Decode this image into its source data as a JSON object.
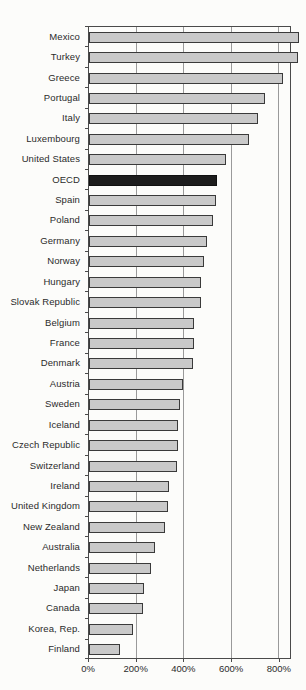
{
  "chart_data": {
    "type": "bar",
    "orientation": "horizontal",
    "title": "",
    "xlabel": "",
    "ylabel": "",
    "categories": [
      "Mexico",
      "Turkey",
      "Greece",
      "Portugal",
      "Italy",
      "Luxembourg",
      "United States",
      "OECD",
      "Spain",
      "Poland",
      "Germany",
      "Norway",
      "Hungary",
      "Slovak Republic",
      "Belgium",
      "France",
      "Denmark",
      "Austria",
      "Sweden",
      "Iceland",
      "Czech Republic",
      "Switzerland",
      "Ireland",
      "United Kingdom",
      "New Zealand",
      "Australia",
      "Netherlands",
      "Japan",
      "Canada",
      "Korea, Rep.",
      "Finland"
    ],
    "values": [
      880,
      875,
      815,
      735,
      705,
      670,
      570,
      535,
      528,
      515,
      493,
      480,
      464,
      464,
      434,
      434,
      432,
      391,
      377,
      369,
      368,
      363,
      329,
      324,
      312,
      270,
      254,
      224,
      219,
      177,
      123
    ],
    "unit": "%",
    "xlim": [
      0,
      851
    ],
    "x_ticks": [
      0,
      200,
      400,
      600,
      800
    ],
    "x_tick_labels": [
      "0%",
      "200%",
      "400%",
      "600%",
      "800%"
    ],
    "grid": true,
    "legend": "none",
    "highlight_category": "OECD",
    "colors": {
      "bar_fill": "#c9c9c9",
      "bar_border": "#3a3a3a",
      "highlight_fill": "#1d1d1d",
      "highlight_border": "#101010",
      "grid_color": "#9a9a9a",
      "axis_color": "#4a4a4a",
      "label_color": "#2b2b2b",
      "background": "#fcfcfa"
    }
  }
}
